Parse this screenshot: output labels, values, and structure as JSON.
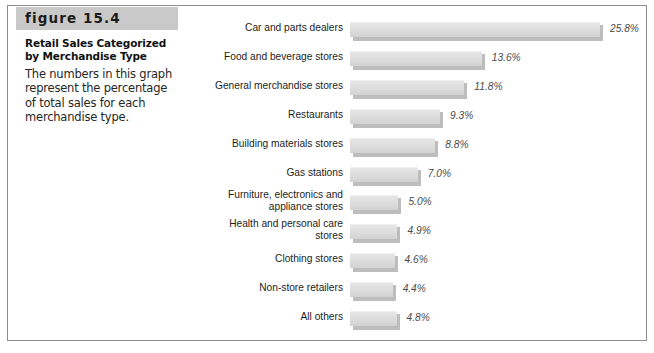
{
  "figure": {
    "banner_label": "figure 15.4",
    "title": "Retail Sales Categorized by Merchandise Type",
    "body": "The numbers in this graph represent the percentage of total sales for each merchandise type."
  },
  "colors": {
    "banner_gray": "#c9c9c9",
    "bar_face": "#dcdcdc",
    "bar_shadow": "#bdbdbd",
    "frame_border": "#8d8d8d",
    "text": "#1d1d1d",
    "value_text": "#4a4a4a"
  },
  "chart_data": {
    "type": "bar",
    "orientation": "horizontal",
    "title": "Retail Sales Categorized by Merchandise Type",
    "xlabel": "",
    "ylabel": "",
    "xlim": [
      0,
      25.8
    ],
    "grid": false,
    "legend": "none",
    "value_suffix": "%",
    "categories": [
      "Car and parts dealers",
      "Food and beverage stores",
      "General merchandise stores",
      "Restaurants",
      "Building materials stores",
      "Gas stations",
      "Furniture, electronics and appliance stores",
      "Health and personal care stores",
      "Clothing stores",
      "Non-store retailers",
      "All others"
    ],
    "values": [
      25.8,
      13.6,
      11.8,
      9.3,
      8.8,
      7.0,
      5.0,
      4.9,
      4.6,
      4.4,
      4.8
    ],
    "value_labels": [
      "25.8%",
      "13.6%",
      "11.8%",
      "9.3%",
      "8.8%",
      "7.0%",
      "5.0%",
      "4.9%",
      "4.6%",
      "4.4%",
      "4.8%"
    ],
    "category_lines": [
      [
        "Car and parts dealers"
      ],
      [
        "Food and beverage stores"
      ],
      [
        "General merchandise stores"
      ],
      [
        "Restaurants"
      ],
      [
        "Building materials stores"
      ],
      [
        "Gas stations"
      ],
      [
        "Furniture, electronics and",
        "appliance stores"
      ],
      [
        "Health and personal care",
        "stores"
      ],
      [
        "Clothing stores"
      ],
      [
        "Non-store retailers"
      ],
      [
        "All others"
      ]
    ]
  }
}
